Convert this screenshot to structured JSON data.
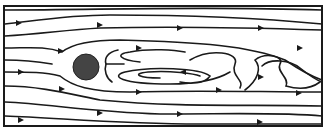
{
  "diagram": {
    "flow_direction": "left-to-right",
    "obstacle": {
      "shape": "circle",
      "color": "#444444"
    },
    "frame_color": "#1a1a1a",
    "line_color": "#1a1a1a",
    "background": "#ffffff",
    "labels": []
  }
}
